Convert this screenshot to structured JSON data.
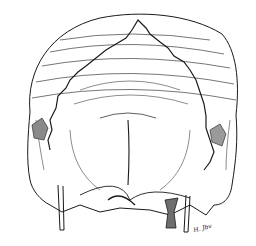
{
  "illustration": {
    "subject": "skull line drawing",
    "signature": "H. Jbv",
    "colors": {
      "ink": "#1a1a1a",
      "shade": "#6e6e6e",
      "background": "#ffffff"
    }
  }
}
